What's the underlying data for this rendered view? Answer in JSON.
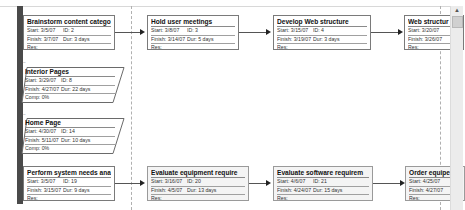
{
  "view": "Network Diagram",
  "labels": {
    "start": "Start:",
    "finish": "Finish:",
    "id": "ID:",
    "dur": "Dur:",
    "res": "Res:",
    "comp": "Comp:"
  },
  "tasks": [
    {
      "name": "Brainstorm content categori",
      "start": "3/5/07",
      "id": "2",
      "finish": "3/7/07",
      "dur": "3 days",
      "res": ""
    },
    {
      "name": "Hold user meetings",
      "start": "3/8/07",
      "id": "3",
      "finish": "3/14/07",
      "dur": "5 days",
      "res": ""
    },
    {
      "name": "Develop Web structure",
      "start": "3/15/07",
      "id": "4",
      "finish": "3/19/07",
      "dur": "3 days",
      "res": ""
    },
    {
      "name": "Web structur",
      "start": "3/20/07",
      "id": "",
      "finish": "3/26/07",
      "dur": "",
      "res": ""
    },
    {
      "name": "Perform system needs analy",
      "start": "3/5/07",
      "id": "19",
      "finish": "3/15/07",
      "dur": "9 days",
      "res": ""
    },
    {
      "name": "Evaluate equipment require",
      "start": "3/16/07",
      "id": "20",
      "finish": "4/5/07",
      "dur": "13 days",
      "res": ""
    },
    {
      "name": "Evaluate software requirem",
      "start": "4/6/07",
      "id": "21",
      "finish": "4/24/07",
      "dur": "15 days",
      "res": ""
    },
    {
      "name": "Order equipe",
      "start": "4/25/07",
      "id": "",
      "finish": "4/27/07",
      "dur": "",
      "res": ""
    }
  ],
  "summaries": [
    {
      "name": "Interior Pages",
      "start": "3/29/07",
      "id": "8",
      "finish": "4/27/07",
      "dur": "22 days",
      "comp": "0%",
      "toggle": "−"
    },
    {
      "name": "Home Page",
      "start": "4/30/07",
      "id": "14",
      "finish": "5/11/07",
      "dur": "10 days",
      "comp": "0%",
      "toggle": "−"
    }
  ],
  "scrollbar": {
    "up_arrow": "▲"
  },
  "colors": {
    "left_bar": "#4a4a4a",
    "node_border": "#7a7a7a",
    "link": "#555555"
  }
}
